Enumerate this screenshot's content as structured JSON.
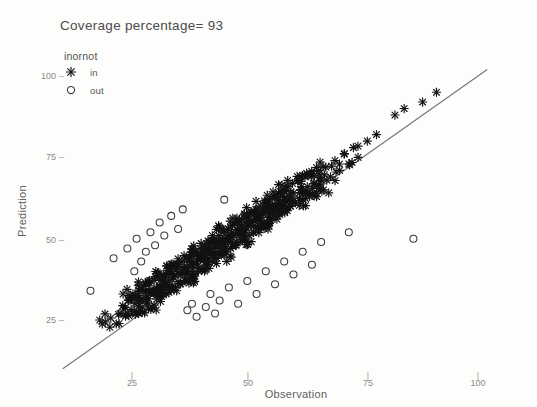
{
  "chart_data": {
    "type": "scatter",
    "title": "Coverage percentage= 93",
    "xlabel": "Observation",
    "ylabel": "Prediction",
    "xlim": [
      5,
      110
    ],
    "ylim": [
      5,
      110
    ],
    "xticks": [
      25,
      50,
      75,
      100
    ],
    "yticks": [
      25,
      50,
      75,
      100
    ],
    "xtick_labels": [
      "25",
      "50",
      "75",
      "100"
    ],
    "ytick_labels": [
      "25",
      "50",
      "75",
      "100"
    ],
    "grid": false,
    "legend": {
      "title": "inornot",
      "position": "top-left",
      "entries": [
        {
          "label": "in",
          "marker": "asterisk-marker"
        },
        {
          "label": "out",
          "marker": "open-circle-marker"
        }
      ]
    },
    "annotations": [
      {
        "name": "identity-reference-line",
        "type": "line",
        "x0": 10,
        "y0": 10,
        "x1": 102,
        "y1": 102
      }
    ],
    "series": [
      {
        "name": "in",
        "marker": "asterisk",
        "color": "#121212",
        "points": [
          [
            18.0,
            25.0
          ],
          [
            19.2,
            24.4
          ],
          [
            20.4,
            25.6
          ],
          [
            21.6,
            23.8
          ],
          [
            22.4,
            27.0
          ],
          [
            23.0,
            29.4
          ],
          [
            23.6,
            26.2
          ],
          [
            24.2,
            31.0
          ],
          [
            24.8,
            28.2
          ],
          [
            25.2,
            33.0
          ],
          [
            25.6,
            30.0
          ],
          [
            26.0,
            27.4
          ],
          [
            26.4,
            34.2
          ],
          [
            26.8,
            31.2
          ],
          [
            27.2,
            29.0
          ],
          [
            27.6,
            35.4
          ],
          [
            28.0,
            32.6
          ],
          [
            28.4,
            30.2
          ],
          [
            28.8,
            36.4
          ],
          [
            29.0,
            33.4
          ],
          [
            29.4,
            28.8
          ],
          [
            29.8,
            37.2
          ],
          [
            30.0,
            34.0
          ],
          [
            30.4,
            31.4
          ],
          [
            30.8,
            38.0
          ],
          [
            31.0,
            35.2
          ],
          [
            31.4,
            32.2
          ],
          [
            31.8,
            39.0
          ],
          [
            32.0,
            36.0
          ],
          [
            32.4,
            33.0
          ],
          [
            32.8,
            40.2
          ],
          [
            33.0,
            37.0
          ],
          [
            33.4,
            34.2
          ],
          [
            33.8,
            41.0
          ],
          [
            34.0,
            38.0
          ],
          [
            34.4,
            35.0
          ],
          [
            34.8,
            42.0
          ],
          [
            35.0,
            39.2
          ],
          [
            35.4,
            36.0
          ],
          [
            35.8,
            43.0
          ],
          [
            36.0,
            40.0
          ],
          [
            36.4,
            37.2
          ],
          [
            36.8,
            44.0
          ],
          [
            37.0,
            41.0
          ],
          [
            37.4,
            38.0
          ],
          [
            37.8,
            45.0
          ],
          [
            38.0,
            42.0
          ],
          [
            38.4,
            39.0
          ],
          [
            38.8,
            46.0
          ],
          [
            39.0,
            43.0
          ],
          [
            39.4,
            40.0
          ],
          [
            39.8,
            47.0
          ],
          [
            40.0,
            44.0
          ],
          [
            40.4,
            41.0
          ],
          [
            40.8,
            48.0
          ],
          [
            41.0,
            45.0
          ],
          [
            41.4,
            42.0
          ],
          [
            41.8,
            49.0
          ],
          [
            42.0,
            46.0
          ],
          [
            42.4,
            43.0
          ],
          [
            42.8,
            50.0
          ],
          [
            43.0,
            47.0
          ],
          [
            43.4,
            44.0
          ],
          [
            43.8,
            51.0
          ],
          [
            44.0,
            48.0
          ],
          [
            44.4,
            45.0
          ],
          [
            44.8,
            52.0
          ],
          [
            45.0,
            49.0
          ],
          [
            45.4,
            46.0
          ],
          [
            45.8,
            53.0
          ],
          [
            46.0,
            50.0
          ],
          [
            46.4,
            47.0
          ],
          [
            46.8,
            54.0
          ],
          [
            47.0,
            51.0
          ],
          [
            47.4,
            48.0
          ],
          [
            47.8,
            55.0
          ],
          [
            48.0,
            52.0
          ],
          [
            48.4,
            49.0
          ],
          [
            48.8,
            56.0
          ],
          [
            49.0,
            53.0
          ],
          [
            49.4,
            50.0
          ],
          [
            49.8,
            57.0
          ],
          [
            50.0,
            54.0
          ],
          [
            50.4,
            51.0
          ],
          [
            50.8,
            58.0
          ],
          [
            51.0,
            55.0
          ],
          [
            51.4,
            52.0
          ],
          [
            51.8,
            59.0
          ],
          [
            52.0,
            56.0
          ],
          [
            52.4,
            53.0
          ],
          [
            52.8,
            60.0
          ],
          [
            53.0,
            57.0
          ],
          [
            53.4,
            54.0
          ],
          [
            53.8,
            61.0
          ],
          [
            54.0,
            58.0
          ],
          [
            54.4,
            55.0
          ],
          [
            54.8,
            62.0
          ],
          [
            55.0,
            59.0
          ],
          [
            55.4,
            56.0
          ],
          [
            55.8,
            63.0
          ],
          [
            56.0,
            60.0
          ],
          [
            56.4,
            57.0
          ],
          [
            56.8,
            64.0
          ],
          [
            57.0,
            61.0
          ],
          [
            57.4,
            58.0
          ],
          [
            57.8,
            65.0
          ],
          [
            58.0,
            62.0
          ],
          [
            58.4,
            59.0
          ],
          [
            58.8,
            66.0
          ],
          [
            59.0,
            63.0
          ],
          [
            59.4,
            60.0
          ],
          [
            59.8,
            67.0
          ],
          [
            60.0,
            64.0
          ],
          [
            60.4,
            61.0
          ],
          [
            61.0,
            68.0
          ],
          [
            61.5,
            65.0
          ],
          [
            62.0,
            62.0
          ],
          [
            62.5,
            69.0
          ],
          [
            63.0,
            66.0
          ],
          [
            63.5,
            63.0
          ],
          [
            64.0,
            70.0
          ],
          [
            64.5,
            67.0
          ],
          [
            65.0,
            64.0
          ],
          [
            65.5,
            71.0
          ],
          [
            66.0,
            68.0
          ],
          [
            66.5,
            65.0
          ],
          [
            67.0,
            72.0
          ],
          [
            68.0,
            69.0
          ],
          [
            69.0,
            74.0
          ],
          [
            70.0,
            71.0
          ],
          [
            71.0,
            76.0
          ],
          [
            72.0,
            73.0
          ],
          [
            73.0,
            78.0
          ],
          [
            74.0,
            75.0
          ],
          [
            76.0,
            80.0
          ],
          [
            78.0,
            82.0
          ],
          [
            82.0,
            88.0
          ],
          [
            84.0,
            90.0
          ],
          [
            88.0,
            92.0
          ],
          [
            91.0,
            95.0
          ]
        ]
      },
      {
        "name": "out",
        "marker": "open-circle",
        "color": "#3b3b3b",
        "points": [
          [
            16.0,
            34.0
          ],
          [
            21.0,
            44.0
          ],
          [
            24.0,
            47.0
          ],
          [
            25.5,
            40.0
          ],
          [
            26.0,
            50.0
          ],
          [
            27.0,
            43.0
          ],
          [
            28.0,
            46.0
          ],
          [
            29.0,
            52.0
          ],
          [
            30.0,
            48.0
          ],
          [
            31.0,
            55.0
          ],
          [
            32.0,
            51.0
          ],
          [
            33.5,
            57.0
          ],
          [
            35.0,
            53.0
          ],
          [
            36.0,
            59.0
          ],
          [
            37.0,
            28.0
          ],
          [
            38.0,
            30.0
          ],
          [
            39.0,
            26.0
          ],
          [
            41.0,
            29.0
          ],
          [
            42.0,
            33.0
          ],
          [
            43.0,
            27.0
          ],
          [
            44.0,
            31.0
          ],
          [
            45.0,
            62.0
          ],
          [
            46.0,
            35.0
          ],
          [
            48.0,
            30.0
          ],
          [
            50.0,
            37.0
          ],
          [
            52.0,
            33.0
          ],
          [
            54.0,
            40.0
          ],
          [
            56.0,
            36.0
          ],
          [
            58.0,
            43.0
          ],
          [
            60.0,
            39.0
          ],
          [
            62.0,
            46.0
          ],
          [
            64.0,
            42.0
          ],
          [
            66.0,
            49.0
          ],
          [
            72.0,
            52.0
          ],
          [
            86.0,
            50.0
          ]
        ]
      }
    ]
  },
  "axes_geometry": {
    "x_px": {
      "25": 132,
      "50": 248,
      "75": 368,
      "100": 478
    },
    "y_px": {
      "25": 320,
      "50": 240,
      "75": 157,
      "100": 76
    }
  }
}
